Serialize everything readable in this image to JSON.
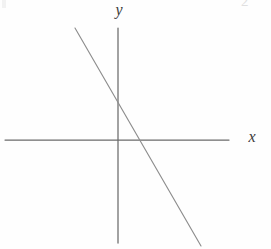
{
  "figure": {
    "kind": "coordinate-axes-line-graph",
    "background_color": "#fefefe",
    "stroke_color": "#6b6b6b",
    "line_color": "#8d8d8d",
    "label_color": "#3a3a3a",
    "width": 271,
    "height": 249
  },
  "labels": {
    "y_axis": "y",
    "x_axis": "x",
    "corner_artifact": "2"
  },
  "chart_data": {
    "type": "line",
    "title": "",
    "xlabel": "x",
    "ylabel": "y",
    "grid": false,
    "legend": null,
    "origin_px": [
      117,
      140
    ],
    "axes": {
      "x_axis": {
        "label": "x",
        "start_px": [
          5,
          140
        ],
        "end_px": [
          229,
          140
        ],
        "orientation": "horizontal",
        "arrow": false
      },
      "y_axis": {
        "label": "y",
        "start_px": [
          118,
          28
        ],
        "end_px": [
          118,
          243
        ],
        "orientation": "vertical",
        "arrow": false
      }
    },
    "series": [
      {
        "name": "line",
        "slope_sign": "negative",
        "start_px": [
          75,
          28
        ],
        "end_px": [
          201,
          246
        ],
        "y_intercept_px": [
          118,
          101
        ],
        "x_intercept_px": [
          141,
          140
        ],
        "x": [
          -2.4,
          4.6
        ],
        "y": [
          2.2,
          -5.9
        ],
        "description": "single straight line with negative slope crossing both axes"
      }
    ],
    "xlim": [
      -6.4,
      6.4
    ],
    "ylim": [
      -5.9,
      6.4
    ]
  }
}
